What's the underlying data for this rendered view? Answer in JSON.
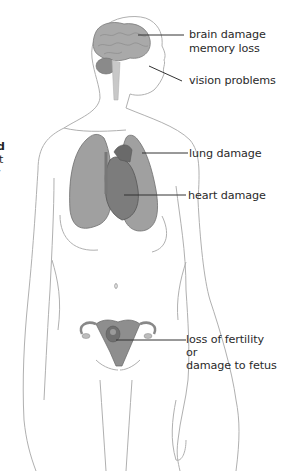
{
  "diagram": {
    "colors": {
      "outline": "#a8a8a8",
      "organ_fill": "#9c9c9c",
      "organ_dark": "#6e6e6e",
      "leader_line": "#333333",
      "text": "#2a2a2a",
      "background": "#ffffff"
    },
    "left_fragment_text": [
      "d",
      "t",
      "·"
    ],
    "labels": [
      {
        "id": "brain",
        "lines": [
          "brain damage",
          "memory loss"
        ],
        "organ": "brain"
      },
      {
        "id": "vision",
        "lines": [
          "vision problems"
        ],
        "organ": "eye"
      },
      {
        "id": "lung",
        "lines": [
          "lung damage"
        ],
        "organ": "lungs"
      },
      {
        "id": "heart",
        "lines": [
          "heart damage"
        ],
        "organ": "heart"
      },
      {
        "id": "reproductive",
        "lines": [
          "loss of fertility",
          "or",
          "damage to fetus"
        ],
        "organ": "uterus"
      }
    ]
  }
}
